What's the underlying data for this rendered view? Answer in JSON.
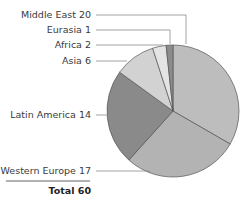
{
  "chart_data": {
    "type": "pie",
    "title": "",
    "categories": [
      "Middle East",
      "Western Europe",
      "Latin America",
      "Asia",
      "Africa",
      "Eurasia"
    ],
    "values": [
      20,
      17,
      14,
      6,
      2,
      1
    ],
    "total": 60,
    "labels": [
      "Middle East 20",
      "Eurasia 1",
      "Africa 2",
      "Asia 6",
      "Latin America 14",
      "Western Europe 17"
    ],
    "total_label": "Total 60",
    "colors": {
      "Middle East": "#bdbdbd",
      "Western Europe": "#b3b3b3",
      "Latin America": "#8a8a8a",
      "Asia": "#d2d2d2",
      "Africa": "#e4e4e4",
      "Eurasia": "#8c8c8c"
    },
    "legend_position": "left (leader lines)"
  }
}
